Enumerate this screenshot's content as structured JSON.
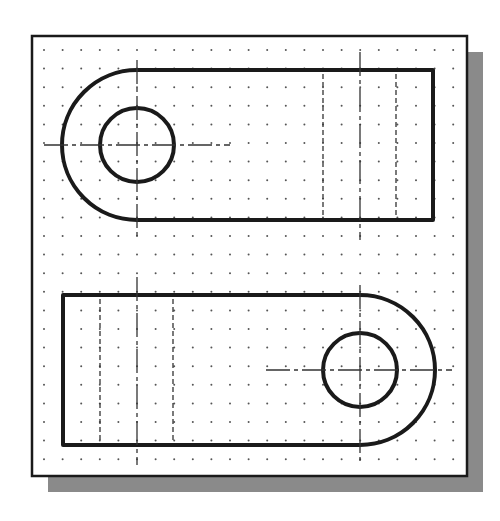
{
  "figure": {
    "colors": {
      "background": "#ffffff",
      "sheet": "#ffffff",
      "sheet_border": "#1a1a1a",
      "shadow": "#8a8a8a",
      "object_line": "#1a1a1a",
      "hidden_line": "#333333",
      "center_line": "#333333",
      "grid_dot": "#555555"
    },
    "sheet": {
      "x": 32,
      "y": 36,
      "width": 435,
      "height": 440,
      "shadow_offset": 16
    },
    "grid": {
      "start_x": 44,
      "start_y": 50,
      "spacing": 18.6
    },
    "views": [
      {
        "name": "top-view",
        "outline": {
          "left_arc_center": [
            137,
            145
          ],
          "arc_radius": 75,
          "right_x": 433
        },
        "hole": {
          "center": [
            137,
            145
          ],
          "radius": 37
        },
        "hidden_lines_x": [
          323,
          396
        ],
        "center_line_vertical_x": 360
      },
      {
        "name": "front-view",
        "outline": {
          "left_x": 63,
          "right_arc_center": [
            360,
            370
          ],
          "arc_radius": 75
        },
        "hole": {
          "center": [
            360,
            370
          ],
          "radius": 37
        },
        "hidden_lines_x": [
          100,
          173
        ],
        "center_line_vertical_x": 137
      }
    ]
  }
}
